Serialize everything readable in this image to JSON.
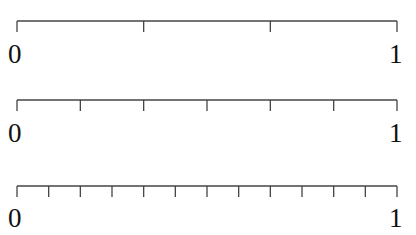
{
  "diagram": {
    "type": "number-lines",
    "line_color": "#444444",
    "number_lines": [
      {
        "start_label": "0",
        "end_label": "1",
        "divisions": 3,
        "y": 21
      },
      {
        "start_label": "0",
        "end_label": "1",
        "divisions": 6,
        "y": 100
      },
      {
        "start_label": "0",
        "end_label": "1",
        "divisions": 12,
        "y": 186
      }
    ]
  }
}
